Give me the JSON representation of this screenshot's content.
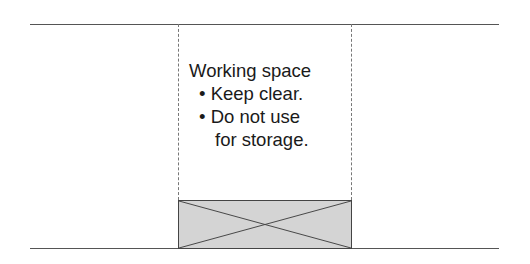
{
  "diagram": {
    "title": "Working space",
    "bullets": [
      {
        "marker": "•",
        "text": "Keep clear."
      },
      {
        "marker": "•",
        "text": "Do not use"
      }
    ],
    "bullet_continuation": "for storage.",
    "colors": {
      "wall_line": "#555555",
      "dashed_line": "#777777",
      "object_fill": "#d4d4d4",
      "object_stroke": "#444444"
    }
  }
}
